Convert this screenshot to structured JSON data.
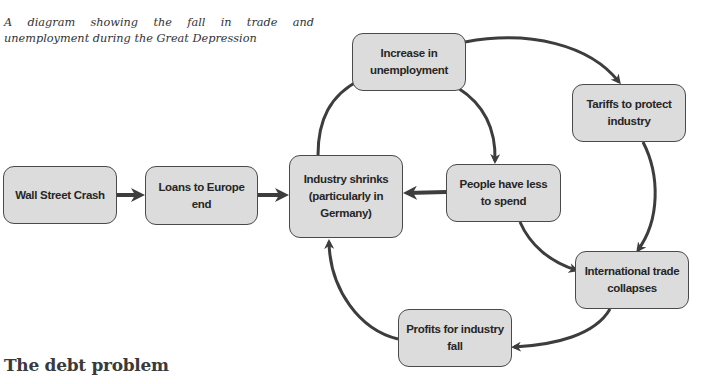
{
  "caption": "A diagram showing the fall in trade and unemployment during the Great Depression",
  "section_heading": "The debt problem",
  "colors": {
    "box_fill": "#dcdcdc",
    "box_border": "#4a4a4a",
    "arrow": "#3d3d3d",
    "text": "#262626"
  },
  "nodes": {
    "wall_street_crash": "Wall Street Crash",
    "loans_to_europe_end": "Loans to Europe end",
    "industry_shrinks": "Industry shrinks (particularly in Germany)",
    "increase_in_unemployment": "Increase in unemployment",
    "tariffs_to_protect_industry": "Tariffs to protect industry",
    "people_have_less_to_spend": "People have less to spend",
    "international_trade_collapses": "International trade collapses",
    "profits_for_industry_fall": "Profits for industry fall"
  },
  "edges": [
    {
      "from": "wall_street_crash",
      "to": "loans_to_europe_end"
    },
    {
      "from": "loans_to_europe_end",
      "to": "industry_shrinks"
    },
    {
      "from": "industry_shrinks",
      "to": "increase_in_unemployment"
    },
    {
      "from": "increase_in_unemployment",
      "to": "tariffs_to_protect_industry"
    },
    {
      "from": "increase_in_unemployment",
      "to": "people_have_less_to_spend"
    },
    {
      "from": "people_have_less_to_spend",
      "to": "industry_shrinks"
    },
    {
      "from": "people_have_less_to_spend",
      "to": "international_trade_collapses"
    },
    {
      "from": "tariffs_to_protect_industry",
      "to": "international_trade_collapses"
    },
    {
      "from": "international_trade_collapses",
      "to": "profits_for_industry_fall"
    },
    {
      "from": "profits_for_industry_fall",
      "to": "industry_shrinks"
    }
  ]
}
